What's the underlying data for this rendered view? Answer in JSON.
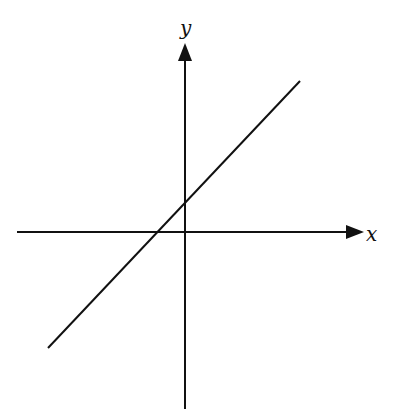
{
  "diagram": {
    "type": "coordinate-plane-with-line",
    "background": "#ffffff",
    "stroke_color": "#111111",
    "axes": {
      "x": {
        "label": "x",
        "from": [
          17,
          232
        ],
        "to": [
          362,
          232
        ],
        "arrow": "right"
      },
      "y": {
        "label": "y",
        "from": [
          185,
          409
        ],
        "to": [
          185,
          43
        ],
        "arrow": "up"
      }
    },
    "line": {
      "from": [
        48,
        348
      ],
      "to": [
        300,
        81
      ],
      "slope_sign": "positive",
      "y_intercept": "positive",
      "x_intercept": "negative"
    }
  }
}
